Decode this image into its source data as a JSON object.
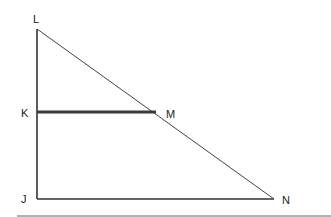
{
  "diagram": {
    "type": "triangle",
    "points": {
      "L": {
        "label": "L",
        "x": 37,
        "y": 29
      },
      "K": {
        "label": "K",
        "x": 37,
        "y": 112
      },
      "J": {
        "label": "J",
        "x": 37,
        "y": 199
      },
      "M": {
        "label": "M",
        "x": 156,
        "y": 112
      },
      "N": {
        "label": "N",
        "x": 274,
        "y": 199
      }
    },
    "segments": [
      "LJ",
      "JN",
      "LN",
      "KM"
    ],
    "colors": {
      "line": "#333333",
      "km_segment": "#3a3a3a",
      "rule": "#999999"
    }
  }
}
